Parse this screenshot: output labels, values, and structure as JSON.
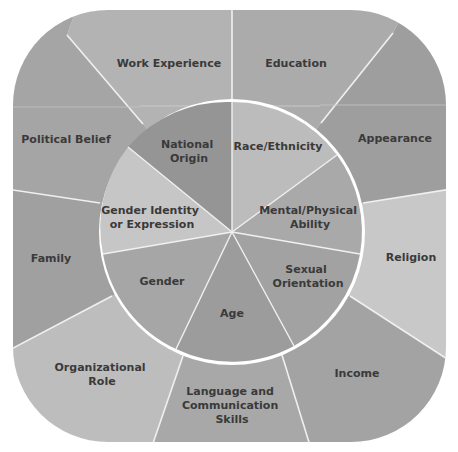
{
  "diagram": {
    "type": "two-ring diversity wheel",
    "colors": {
      "background": "#ffffff",
      "divider": "#f2f2f2",
      "text": "#3a3a3a"
    },
    "outer_ring": [
      {
        "label": "Work Experience",
        "lines": [
          "Work Experience"
        ],
        "color": "#b3b3b3"
      },
      {
        "label": "Education",
        "lines": [
          "Education"
        ],
        "color": "#ababab"
      },
      {
        "label": "Appearance",
        "lines": [
          "Appearance"
        ],
        "color": "#9e9e9e"
      },
      {
        "label": "Religion",
        "lines": [
          "Religion"
        ],
        "color": "#c8c8c8"
      },
      {
        "label": "Income",
        "lines": [
          "Income"
        ],
        "color": "#a3a3a3"
      },
      {
        "label": "Language and Communication Skills",
        "lines": [
          "Language and",
          "Communication",
          "Skills"
        ],
        "color": "#a8a8a8"
      },
      {
        "label": "Organizational Role",
        "lines": [
          "Organizational",
          "Role"
        ],
        "color": "#bdbdbd"
      },
      {
        "label": "Family",
        "lines": [
          "Family"
        ],
        "color": "#a0a0a0"
      },
      {
        "label": "Political Belief",
        "lines": [
          "Political Belief"
        ],
        "color": "#a5a5a5"
      }
    ],
    "inner_ring": [
      {
        "label": "Race/Ethnicity",
        "lines": [
          "Race/Ethnicity"
        ],
        "color": "#bcbcbc"
      },
      {
        "label": "Mental/Physical Ability",
        "lines": [
          "Mental/Physical",
          "Ability"
        ],
        "color": "#a9a9a9"
      },
      {
        "label": "Sexual Orientation",
        "lines": [
          "Sexual",
          "Orientation"
        ],
        "color": "#a2a2a2"
      },
      {
        "label": "Age",
        "lines": [
          "Age"
        ],
        "color": "#9c9c9c"
      },
      {
        "label": "Gender",
        "lines": [
          "Gender"
        ],
        "color": "#a6a6a6"
      },
      {
        "label": "Gender Identity or Expression",
        "lines": [
          "Gender Identity",
          "or Expression"
        ],
        "color": "#c6c6c6"
      },
      {
        "label": "National Origin",
        "lines": [
          "National",
          "Origin"
        ],
        "color": "#959595"
      }
    ]
  }
}
